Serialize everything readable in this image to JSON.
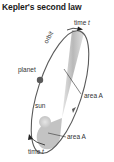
{
  "title": "Kepler's second law",
  "labels": {
    "time_top": "time",
    "time_top_var": "t",
    "orbit": "orbit",
    "planet": "planet",
    "sun": "sun",
    "area_upper": "area A",
    "area_lower": "area A",
    "time_bottom": "time",
    "time_bottom_var": "t"
  },
  "colors": {
    "orbit": "#5a5a5a",
    "area_fill": "#b8b8b8",
    "planet": "#555555",
    "sun": "#d0d0d0",
    "text": "#333333"
  }
}
